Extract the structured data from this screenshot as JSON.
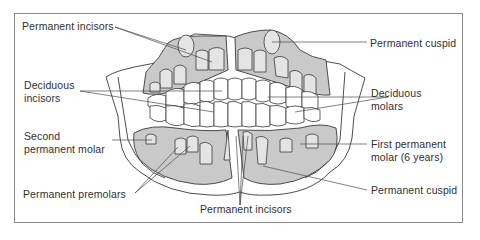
{
  "figure": {
    "type": "labeled anatomical illustration",
    "colors": {
      "bone_shading": "#c9c9c9",
      "outline": "#3a3a3a",
      "leader_line": "#4a4a4a",
      "frame_border": "#8a8a8a",
      "background": "#ffffff"
    }
  },
  "labels": {
    "permanent_incisors_top": "Permanent incisors",
    "permanent_cuspid_top": "Permanent cuspid",
    "deciduous_incisors_line1": "Deciduous",
    "deciduous_incisors_line2": "incisors",
    "deciduous_molars_line1": "Deciduous",
    "deciduous_molars_line2": "molars",
    "second_permanent_molar_line1": "Second",
    "second_permanent_molar_line2": "permanent molar",
    "first_permanent_molar_line1": "First permanent",
    "first_permanent_molar_line2": "molar (6 years)",
    "permanent_premolars": "Permanent premolars",
    "permanent_cuspid_bottom": "Permanent cuspid",
    "permanent_incisors_bottom": "Permanent incisors"
  }
}
